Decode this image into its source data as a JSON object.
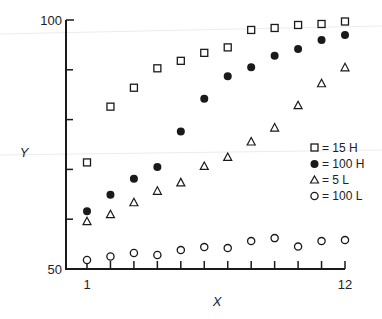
{
  "chart_data": {
    "type": "scatter",
    "title": "",
    "xlabel": "X",
    "ylabel": "Y",
    "xlim": [
      1,
      12
    ],
    "ylim": [
      50,
      100
    ],
    "x_tick_labels": [
      "1",
      "12"
    ],
    "y_tick_labels": [
      "50",
      "100"
    ],
    "x_ticks": [
      1,
      2,
      3,
      4,
      5,
      6,
      7,
      8,
      9,
      10,
      11,
      12
    ],
    "y_ticks": [
      50,
      60,
      70,
      80,
      90,
      100
    ],
    "grid": false,
    "legend_position": "right-middle",
    "x": [
      1,
      2,
      3,
      4,
      5,
      6,
      7,
      8,
      9,
      10,
      11,
      12
    ],
    "series": [
      {
        "name": "15 H",
        "marker": "open-square",
        "values": [
          71.4,
          82.6,
          86.4,
          90.3,
          91.8,
          93.4,
          94.5,
          98.0,
          98.4,
          99.0,
          99.2,
          99.7
        ]
      },
      {
        "name": "100 H",
        "marker": "filled-circle",
        "values": [
          61.6,
          64.9,
          68.1,
          70.5,
          77.6,
          84.2,
          88.7,
          90.5,
          92.8,
          94.2,
          96.0,
          97.0
        ]
      },
      {
        "name": "5 L",
        "marker": "open-triangle",
        "values": [
          59.6,
          61.0,
          63.4,
          65.7,
          67.4,
          70.7,
          72.5,
          75.6,
          78.4,
          82.9,
          87.3,
          90.5
        ]
      },
      {
        "name": "100 L",
        "marker": "open-circle",
        "values": [
          51.8,
          52.5,
          53.2,
          52.8,
          53.8,
          54.4,
          54.2,
          55.6,
          56.2,
          54.5,
          55.6,
          55.8
        ]
      }
    ]
  },
  "labels": {
    "y_axis": "Y",
    "x_axis": "X",
    "y_top": "100",
    "y_bottom": "50",
    "x_first": "1",
    "x_last": "12"
  },
  "legend": [
    {
      "symbol": "open-square",
      "text": "= 15 H"
    },
    {
      "symbol": "filled-circle",
      "text": "= 100 H"
    },
    {
      "symbol": "open-triangle",
      "text": "= 5 L"
    },
    {
      "symbol": "open-circle",
      "text": "= 100 L"
    }
  ],
  "colors": {
    "ink": "#1a1a1a",
    "background": "#ffffff"
  }
}
